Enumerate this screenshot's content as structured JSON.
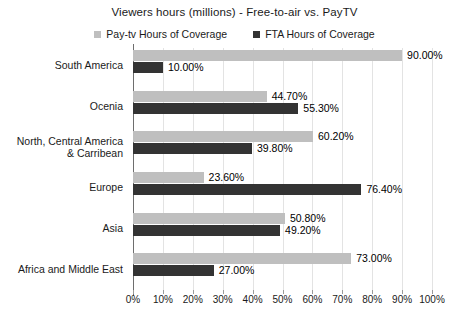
{
  "chart_data": {
    "type": "bar",
    "orientation": "horizontal",
    "title": "Viewers hours (millions) - Free-to-air vs. PayTV",
    "xlabel": "",
    "ylabel": "",
    "xlim": [
      0,
      100
    ],
    "grid": true,
    "legend_position": "top-center",
    "categories": [
      "South America",
      "Ocenia",
      "North, Central America & Carribean",
      "Europe",
      "Asia",
      "Africa and Middle East"
    ],
    "series": [
      {
        "name": "Pay-tv Hours of Coverage",
        "color": "#bfbfbf",
        "values": [
          90.0,
          44.7,
          60.2,
          23.6,
          50.8,
          73.0
        ],
        "labels": [
          "90.00%",
          "44.70%",
          "60.20%",
          "23.60%",
          "50.80%",
          "73.00%"
        ]
      },
      {
        "name": "FTA Hours of Coverage",
        "color": "#333333",
        "values": [
          10.0,
          55.3,
          39.8,
          76.4,
          49.2,
          27.0
        ],
        "labels": [
          "10.00%",
          "55.30%",
          "39.80%",
          "76.40%",
          "49.20%",
          "27.00%"
        ]
      }
    ],
    "xticks": [
      "0%",
      "10%",
      "20%",
      "30%",
      "40%",
      "50%",
      "60%",
      "70%",
      "80%",
      "90%",
      "100%"
    ],
    "xtick_values": [
      0,
      10,
      20,
      30,
      40,
      50,
      60,
      70,
      80,
      90,
      100
    ]
  },
  "category_lines": [
    [
      "South America"
    ],
    [
      "Ocenia"
    ],
    [
      "North, Central America",
      "& Carribean"
    ],
    [
      "Europe"
    ],
    [
      "Asia"
    ],
    [
      "Africa and Middle East"
    ]
  ],
  "colors": {
    "pay_tv": "#bfbfbf",
    "fta": "#333333",
    "gridline": "#e3e3e3",
    "axis": "#6e6e6e",
    "text": "#1a1a1a",
    "background": "#ffffff"
  }
}
